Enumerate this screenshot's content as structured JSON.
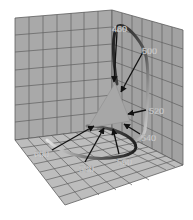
{
  "figure": {
    "type": "3d-diagram"
  },
  "colors": {
    "background": "#ffffff",
    "wall_fill": "#a9a9a9",
    "floor_fill": "#bdbdbd",
    "grid_line": "#5e5e5e",
    "triangle_fill": "#a6a6a6",
    "loop_dark": "#2a2a2a",
    "loop_light": "#d9d9d9",
    "arrow": "#111111",
    "label": "#f2f2f2"
  },
  "wavelength_labels": [
    {
      "id": "w460",
      "text": "460"
    },
    {
      "id": "w500",
      "text": "500"
    },
    {
      "id": "w520",
      "text": "520"
    },
    {
      "id": "w540",
      "text": "540"
    },
    {
      "id": "w560",
      "text": "560"
    },
    {
      "id": "w580",
      "text": "580"
    },
    {
      "id": "w600",
      "text": "600"
    }
  ]
}
